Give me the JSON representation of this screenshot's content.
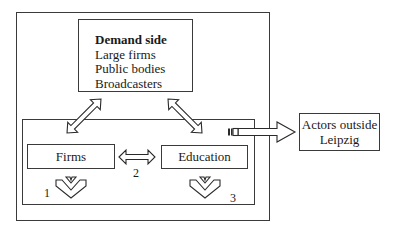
{
  "diagram": {
    "demand_box": {
      "title": "Demand side",
      "items": [
        "Large firms",
        "Public bodies",
        "Broadcasters"
      ]
    },
    "firms_box": {
      "label": "Firms"
    },
    "education_box": {
      "label": "Education"
    },
    "actors_box": {
      "line1": "Actors outside",
      "line2": "Leipzig"
    },
    "labels": {
      "n1": "1",
      "n2": "2",
      "n3": "3"
    },
    "colors": {
      "stroke": "#3a3a3a",
      "background": "#ffffff"
    }
  }
}
